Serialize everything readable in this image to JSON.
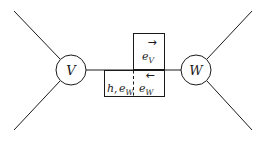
{
  "figure": {
    "background_color": "#ffffff",
    "stroke_color": "#1a1a1a",
    "width": 266,
    "height": 141,
    "type": "graph-of-groups-diagram"
  },
  "vertices": [
    {
      "id": "V",
      "label": "V",
      "cx": 71,
      "cy": 70,
      "r": 15
    },
    {
      "id": "W",
      "label": "W",
      "cx": 196,
      "cy": 70,
      "r": 15
    }
  ],
  "edge": {
    "y": 70,
    "x_start": 86,
    "x_end": 181
  },
  "external_legs": [
    {
      "name": "upper-left-leg",
      "x1": 14,
      "y1": 11,
      "x2": 60,
      "y2": 59
    },
    {
      "name": "lower-left-leg",
      "x1": 14,
      "y1": 130,
      "x2": 60,
      "y2": 81
    },
    {
      "name": "upper-right-leg",
      "x1": 252,
      "y1": 11,
      "x2": 207,
      "y2": 59
    },
    {
      "name": "lower-right-leg",
      "x1": 252,
      "y1": 130,
      "x2": 207,
      "y2": 81
    }
  ],
  "boxes": {
    "upper": {
      "x": 133,
      "y": 33,
      "width": 32,
      "height": 37
    },
    "lower": {
      "x": 104,
      "y": 70,
      "width": 61,
      "height": 27
    },
    "dashed_divider": {
      "x": 133,
      "y1": 70,
      "y2": 97
    }
  },
  "labels": {
    "vertex_v": "V",
    "vertex_w": "W",
    "upper_right": {
      "name": "e_V",
      "base": "e",
      "subscript": "V",
      "arrow": "right-arrow",
      "arrow_glyph": "→"
    },
    "lower_right": {
      "name": "e_W",
      "base": "e",
      "subscript": "W",
      "arrow": "left-arrow",
      "arrow_glyph": "←"
    },
    "lower_left": {
      "name": "h, e_W",
      "first": "h",
      "separator": ",",
      "base": "e",
      "subscript": "W"
    }
  }
}
